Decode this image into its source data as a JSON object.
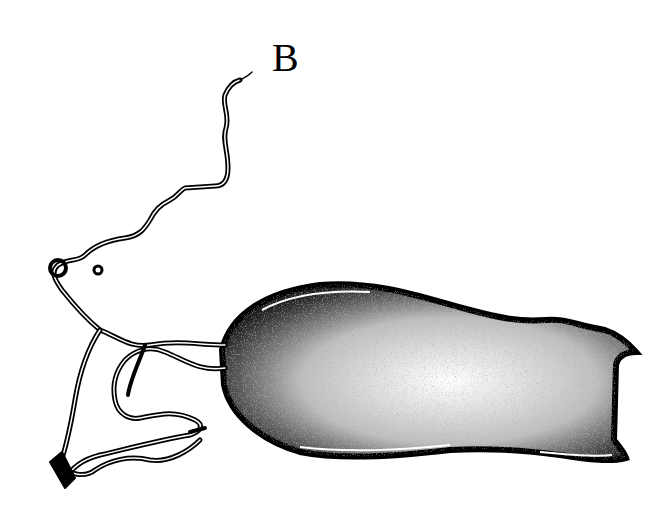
{
  "figure": {
    "panel_label": "B",
    "colors": {
      "ink": "#000000",
      "paper": "#ffffff"
    }
  }
}
